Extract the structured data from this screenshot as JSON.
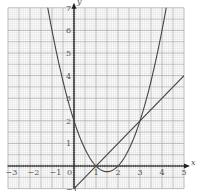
{
  "chart_data": {
    "type": "line",
    "title": "",
    "xlabel": "x",
    "ylabel": "y",
    "xlim": [
      -3,
      5
    ],
    "ylim": [
      -1,
      7
    ],
    "grid": true,
    "x_ticks": [
      "-3",
      "-2",
      "-1",
      "0",
      "1",
      "2",
      "3",
      "4",
      "5"
    ],
    "y_ticks": [
      "-1",
      "1",
      "2",
      "3",
      "4",
      "5",
      "6",
      "7"
    ],
    "series": [
      {
        "name": "y = x^2 - 3x + 2",
        "type": "curve",
        "x": [
          -1.19,
          -1,
          0,
          1,
          1.5,
          2,
          3,
          4,
          4.19
        ],
        "y": [
          7,
          6,
          2,
          0,
          -0.25,
          0,
          2,
          6,
          7
        ]
      },
      {
        "name": "y = x - 1",
        "type": "line",
        "x": [
          0,
          1,
          3,
          5
        ],
        "y": [
          -1,
          0,
          2,
          4
        ]
      }
    ],
    "intersections": [
      [
        1,
        0
      ],
      [
        3,
        2
      ]
    ]
  },
  "colors": {
    "grid_minor": "#d6d6d6",
    "grid_major": "#a8a8a8",
    "curve": "#444444",
    "axis": "#222222"
  }
}
